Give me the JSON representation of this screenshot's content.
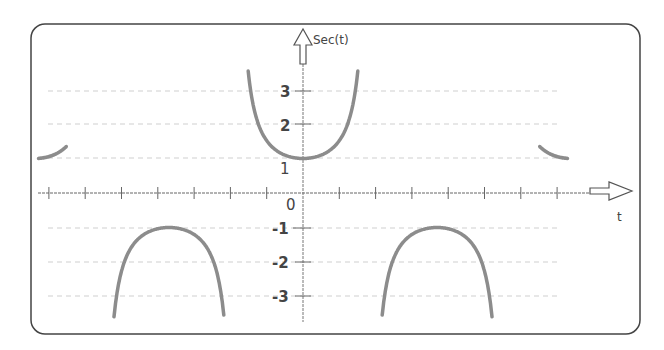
{
  "chart_data": {
    "type": "line",
    "title": "",
    "function": "sec(t)",
    "ylabel": "Sec(t)",
    "xlabel": "t",
    "origin_label": "0",
    "y_ticks": [
      {
        "value": 3,
        "label": "3"
      },
      {
        "value": 2,
        "label": "2"
      },
      {
        "value": 1,
        "label": "1"
      },
      {
        "value": -1,
        "label": "-1"
      },
      {
        "value": -2,
        "label": "-2"
      },
      {
        "value": -3,
        "label": "-3"
      }
    ],
    "x_tick_count_left": 7,
    "x_tick_count_right": 7,
    "grid": "dashed horizontal at y = ±1, ±2, ±3",
    "ylim": [
      -3.6,
      3.6
    ],
    "xlim_radians": [
      -6.4,
      6.6
    ],
    "series": [
      {
        "name": "sec(t) branch",
        "t_range": [
          -6.2,
          -5.55
        ],
        "y_range": [
          1,
          3.6
        ]
      },
      {
        "name": "sec(t) branch",
        "t_range": [
          -4.5,
          -1.7
        ],
        "y_range": [
          -3.6,
          -1
        ]
      },
      {
        "name": "sec(t) branch",
        "t_range": [
          -1.3,
          1.3
        ],
        "y_range": [
          1,
          3.6
        ]
      },
      {
        "name": "sec(t) branch",
        "t_range": [
          1.7,
          4.5
        ],
        "y_range": [
          -3.6,
          -1
        ]
      },
      {
        "name": "sec(t) branch",
        "t_range": [
          5.55,
          6.2
        ],
        "y_range": [
          1,
          3.6
        ]
      }
    ],
    "colors": {
      "curve": "#8c8c8c",
      "axis": "#555555",
      "grid": "#c8c8c8",
      "frame": "#444444"
    }
  }
}
